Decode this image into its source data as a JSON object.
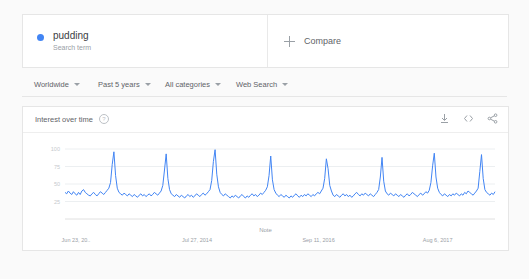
{
  "term_card": {
    "dot_color": "#4285f4",
    "title": "pudding",
    "subtitle": "Search term",
    "compare_label": "Compare"
  },
  "filters": [
    {
      "label": "Worldwide"
    },
    {
      "label": "Past 5 years"
    },
    {
      "label": "All categories"
    },
    {
      "label": "Web Search"
    }
  ],
  "chart_card": {
    "title": "Interest over time",
    "info_glyph": "?",
    "actions": [
      {
        "name": "download-icon"
      },
      {
        "name": "embed-code-icon"
      },
      {
        "name": "share-icon"
      }
    ]
  },
  "chart_data": {
    "type": "line",
    "title": "Interest over time",
    "xlabel": "",
    "ylabel": "",
    "ylim": [
      0,
      100
    ],
    "yticks": [
      100,
      75,
      50,
      25
    ],
    "ytick_labels": [
      "100",
      "75",
      "50",
      "25"
    ],
    "grid": true,
    "legend": "none",
    "annotation": "Note",
    "line_color": "#4285f4",
    "xtick_labels": [
      "Jun 23, 20..",
      "Jul 27, 2014",
      "Sep 11, 2016",
      "Aug 6, 2017"
    ],
    "x_positions_pct": [
      2,
      30,
      58,
      86
    ],
    "values": [
      38,
      36,
      40,
      37,
      35,
      39,
      36,
      34,
      38,
      35,
      40,
      42,
      38,
      36,
      34,
      33,
      36,
      38,
      35,
      33,
      36,
      39,
      37,
      35,
      38,
      41,
      44,
      52,
      78,
      96,
      62,
      44,
      38,
      36,
      34,
      37,
      35,
      33,
      36,
      34,
      32,
      35,
      33,
      31,
      34,
      36,
      33,
      35,
      32,
      34,
      36,
      33,
      35,
      38,
      36,
      34,
      37,
      40,
      48,
      70,
      93,
      58,
      42,
      36,
      34,
      32,
      35,
      33,
      31,
      34,
      32,
      30,
      33,
      35,
      32,
      34,
      31,
      33,
      36,
      34,
      32,
      35,
      37,
      34,
      36,
      39,
      42,
      55,
      82,
      99,
      64,
      46,
      38,
      35,
      33,
      36,
      34,
      32,
      30,
      33,
      31,
      34,
      32,
      30,
      33,
      35,
      32,
      30,
      33,
      31,
      34,
      36,
      33,
      35,
      32,
      34,
      37,
      35,
      38,
      41,
      46,
      62,
      90,
      56,
      42,
      37,
      34,
      32,
      35,
      33,
      31,
      34,
      32,
      30,
      33,
      31,
      34,
      36,
      33,
      31,
      34,
      32,
      35,
      33,
      36,
      34,
      32,
      35,
      33,
      36,
      38,
      36,
      40,
      44,
      58,
      86,
      72,
      48,
      40,
      34,
      32,
      35,
      33,
      31,
      34,
      36,
      33,
      35,
      32,
      34,
      31,
      33,
      36,
      38,
      35,
      33,
      36,
      34,
      37,
      35,
      33,
      36,
      34,
      32,
      35,
      38,
      42,
      60,
      88,
      54,
      40,
      36,
      34,
      37,
      35,
      33,
      36,
      34,
      32,
      35,
      33,
      31,
      34,
      36,
      33,
      35,
      38,
      36,
      34,
      32,
      35,
      37,
      34,
      36,
      39,
      37,
      41,
      52,
      76,
      94,
      60,
      44,
      38,
      35,
      33,
      36,
      34,
      32,
      35,
      33,
      36,
      34,
      37,
      35,
      33,
      36,
      34,
      38,
      36,
      40,
      38,
      36,
      34,
      37,
      40,
      44,
      68,
      92,
      58,
      42,
      38,
      36,
      34,
      37,
      35,
      39
    ]
  }
}
